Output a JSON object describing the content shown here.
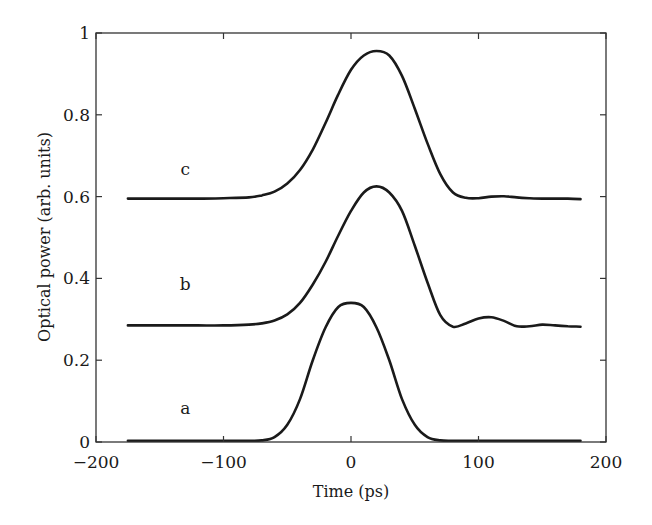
{
  "chart_data": {
    "type": "line",
    "title": "",
    "xlabel": "Time (ps)",
    "ylabel": "Optical power (arb. units)",
    "xlim": [
      -200,
      200
    ],
    "ylim": [
      0,
      1
    ],
    "grid": false,
    "legend": null,
    "xticks": [
      -200,
      -100,
      0,
      100,
      200
    ],
    "xtick_labels": [
      "−200",
      "−100",
      "0",
      "100",
      "200"
    ],
    "yticks": [
      0,
      0.2,
      0.4,
      0.6,
      0.8,
      1
    ],
    "ytick_labels": [
      "0",
      "0.2",
      "0.4",
      "0.6",
      "0.8",
      "1"
    ],
    "annotations": [
      {
        "text": "a",
        "x": -130,
        "y": 0.08
      },
      {
        "text": "b",
        "x": -130,
        "y": 0.385
      },
      {
        "text": "c",
        "x": -130,
        "y": 0.665
      }
    ],
    "x": [
      -175,
      -160,
      -140,
      -120,
      -100,
      -80,
      -70,
      -60,
      -50,
      -40,
      -30,
      -20,
      -10,
      0,
      10,
      20,
      30,
      40,
      50,
      60,
      70,
      80,
      90,
      100,
      110,
      120,
      130,
      140,
      150,
      160,
      170,
      180
    ],
    "series": [
      {
        "name": "a",
        "values": [
          0.003,
          0.003,
          0.003,
          0.003,
          0.003,
          0.003,
          0.004,
          0.012,
          0.042,
          0.105,
          0.2,
          0.28,
          0.33,
          0.34,
          0.33,
          0.28,
          0.2,
          0.105,
          0.042,
          0.012,
          0.004,
          0.003,
          0.003,
          0.003,
          0.003,
          0.003,
          0.003,
          0.003,
          0.003,
          0.003,
          0.003,
          0.003
        ]
      },
      {
        "name": "b",
        "values": [
          0.285,
          0.285,
          0.285,
          0.285,
          0.285,
          0.287,
          0.29,
          0.297,
          0.312,
          0.34,
          0.385,
          0.44,
          0.505,
          0.565,
          0.61,
          0.625,
          0.61,
          0.565,
          0.48,
          0.39,
          0.31,
          0.282,
          0.29,
          0.302,
          0.305,
          0.296,
          0.283,
          0.283,
          0.287,
          0.285,
          0.283,
          0.282
        ]
      },
      {
        "name": "c",
        "values": [
          0.595,
          0.595,
          0.595,
          0.595,
          0.596,
          0.598,
          0.603,
          0.612,
          0.632,
          0.665,
          0.715,
          0.78,
          0.85,
          0.91,
          0.945,
          0.956,
          0.945,
          0.895,
          0.815,
          0.73,
          0.655,
          0.61,
          0.597,
          0.596,
          0.6,
          0.601,
          0.598,
          0.596,
          0.595,
          0.595,
          0.595,
          0.594
        ]
      }
    ]
  },
  "plot": {
    "px_left": 96,
    "px_right": 606,
    "px_top": 33,
    "px_bottom": 442,
    "stroke": "#1a1a1a"
  }
}
